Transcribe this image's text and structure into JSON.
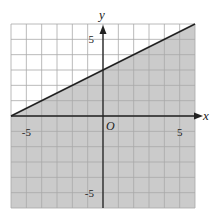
{
  "chart_data": {
    "type": "line",
    "title": "",
    "xlabel": "x",
    "ylabel": "y",
    "origin_label": "O",
    "xlim": [
      -6,
      6
    ],
    "ylim": [
      -6,
      6
    ],
    "grid": true,
    "grid_step": 1,
    "x_tick_labels": [
      {
        "value": -5,
        "label": "-5"
      },
      {
        "value": 5,
        "label": "5"
      }
    ],
    "y_tick_labels": [
      {
        "value": 5,
        "label": "5"
      },
      {
        "value": -5,
        "label": "-5"
      }
    ],
    "series": [
      {
        "name": "boundary",
        "equation": "y = 0.5x + 3",
        "style": "solid",
        "points": [
          {
            "x": -6,
            "y": 0
          },
          {
            "x": 0,
            "y": 3
          },
          {
            "x": 6,
            "y": 6
          }
        ]
      }
    ],
    "shaded_region": "below line (y <= 0.5x + 3)",
    "legend": null
  },
  "colors": {
    "shade": "#cbcbcb",
    "grid": "#a8a8a8",
    "axis": "#222222",
    "line": "#222222",
    "background": "#ffffff"
  }
}
